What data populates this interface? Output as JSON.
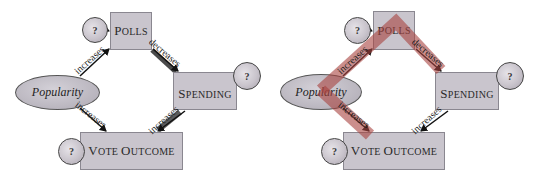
{
  "diagrams": [
    {
      "id": "left",
      "nodes": {
        "popularity": "Popularity",
        "polls_cap": "P",
        "polls_rest": "OLLS",
        "spending_cap": "S",
        "spending_rest": "PENDING",
        "vote_cap1": "V",
        "vote_rest1": "OTE ",
        "vote_cap2": "O",
        "vote_rest2": "UTCOME"
      },
      "question_marks": [
        "?",
        "?",
        "?"
      ],
      "edges": [
        {
          "from": "Popularity",
          "to": "Polls",
          "label": "increases"
        },
        {
          "from": "Polls",
          "to": "Spending",
          "label": "decreases"
        },
        {
          "from": "Spending",
          "to": "Vote Outcome",
          "label": "increases"
        },
        {
          "from": "Popularity",
          "to": "Vote Outcome",
          "label": "increases"
        }
      ],
      "highlight": "none"
    },
    {
      "id": "right",
      "nodes": {
        "popularity": "Popularity",
        "polls_cap": "P",
        "polls_rest": "OLLS",
        "spending_cap": "S",
        "spending_rest": "PENDING",
        "vote_cap1": "V",
        "vote_rest1": "OTE ",
        "vote_cap2": "O",
        "vote_rest2": "UTCOME"
      },
      "question_marks": [
        "?",
        "?",
        "?"
      ],
      "edges": [
        {
          "from": "Popularity",
          "to": "Polls",
          "label": "increases"
        },
        {
          "from": "Polls",
          "to": "Spending",
          "label": "decreases"
        },
        {
          "from": "Spending",
          "to": "Vote Outcome",
          "label": "increases"
        },
        {
          "from": "Popularity",
          "to": "Vote Outcome",
          "label": "increases"
        }
      ],
      "highlight": "Popularity → Polls → Spending path and Popularity → Vote Outcome path",
      "highlight_color": "#a8423f"
    }
  ]
}
